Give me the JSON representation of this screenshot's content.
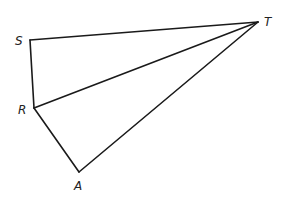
{
  "diagram": {
    "type": "geometry-figure",
    "points": {
      "S": {
        "label": "S",
        "x": 30,
        "y": 40
      },
      "T": {
        "label": "T",
        "x": 258,
        "y": 22
      },
      "R": {
        "label": "R",
        "x": 34,
        "y": 108
      },
      "A": {
        "label": "A",
        "x": 79,
        "y": 172
      }
    },
    "segments": [
      [
        "S",
        "T"
      ],
      [
        "S",
        "R"
      ],
      [
        "R",
        "T"
      ],
      [
        "R",
        "A"
      ],
      [
        "A",
        "T"
      ]
    ],
    "triangles": [
      "SRT",
      "RAT"
    ]
  }
}
